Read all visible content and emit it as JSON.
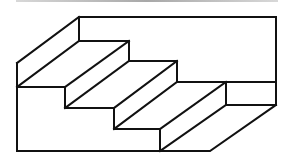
{
  "figure": {
    "title": "",
    "colors": {
      "line": "#111111",
      "background": "#ffffff",
      "top_rule": "#a8a8a8"
    }
  }
}
